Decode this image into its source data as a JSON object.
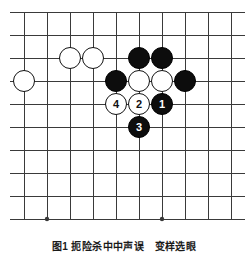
{
  "figure": {
    "caption": "图1 扼险杀中中声误　变样选眼",
    "kind": "go-board-diagram"
  },
  "board": {
    "columns": 10,
    "rows": 10,
    "origin_x": 24,
    "origin_y": 12,
    "spacing": 23,
    "line_color": "#3a3a3a",
    "background": "#ffffff",
    "line_width": 1,
    "star_point_radius": 2.2,
    "star_points": [
      {
        "col": 0,
        "row": 3
      },
      {
        "col": 1,
        "row": 9
      },
      {
        "col": 6,
        "row": 9
      }
    ],
    "edge_overhang": {
      "left": 14,
      "right": 14,
      "top": 0,
      "bottom": 0
    }
  },
  "stones": {
    "radius": 11,
    "black_color": "#0d0d0d",
    "white_color": "#ffffff",
    "list": [
      {
        "id": "w-c2r2",
        "color": "white",
        "col": 2,
        "row": 2,
        "label": ""
      },
      {
        "id": "w-c3r2",
        "color": "white",
        "col": 3,
        "row": 2,
        "label": ""
      },
      {
        "id": "b-c5r2",
        "color": "black",
        "col": 5,
        "row": 2,
        "label": ""
      },
      {
        "id": "b-c6r2",
        "color": "black",
        "col": 6,
        "row": 2,
        "label": ""
      },
      {
        "id": "w-c0r3",
        "color": "white",
        "col": 0,
        "row": 3,
        "label": ""
      },
      {
        "id": "b-c4r3",
        "color": "black",
        "col": 4,
        "row": 3,
        "label": ""
      },
      {
        "id": "w-c5r3",
        "color": "white",
        "col": 5,
        "row": 3,
        "label": ""
      },
      {
        "id": "w-c6r3",
        "color": "white",
        "col": 6,
        "row": 3,
        "label": ""
      },
      {
        "id": "b-c7r3",
        "color": "black",
        "col": 7,
        "row": 3,
        "label": ""
      },
      {
        "id": "w-move-4",
        "color": "white",
        "col": 4,
        "row": 4,
        "label": "4"
      },
      {
        "id": "w-move-2",
        "color": "white",
        "col": 5,
        "row": 4,
        "label": "2"
      },
      {
        "id": "b-move-1",
        "color": "black",
        "col": 6,
        "row": 4,
        "label": "1"
      },
      {
        "id": "b-move-3",
        "color": "black",
        "col": 5,
        "row": 5,
        "label": "3"
      }
    ]
  }
}
